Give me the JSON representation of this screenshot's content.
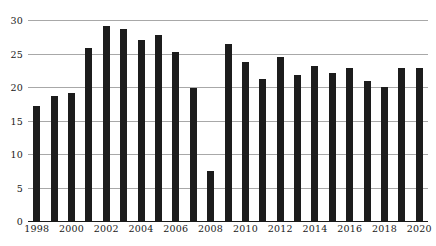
{
  "chart_data": {
    "type": "bar",
    "title": "",
    "xlabel": "",
    "ylabel": "",
    "ylim": [
      0,
      30
    ],
    "yticks": [
      0,
      5,
      10,
      15,
      20,
      25,
      30
    ],
    "grid": true,
    "legend": "none",
    "bar_color": "#1c1c1c",
    "gridline_color": "#a8a8a8",
    "axis_color": "#1a1a1a",
    "background_color": "#ffffff",
    "xtick_step": 2,
    "xtick_labels": [
      "1998",
      "2000",
      "2002",
      "2004",
      "2006",
      "2008",
      "2010",
      "2012",
      "2014",
      "2016",
      "2018",
      "2020"
    ],
    "categories": [
      "1998",
      "1999",
      "2000",
      "2001",
      "2002",
      "2003",
      "2004",
      "2005",
      "2006",
      "2007",
      "2008",
      "2009",
      "2010",
      "2011",
      "2012",
      "2013",
      "2014",
      "2015",
      "2016",
      "2017",
      "2018",
      "2019",
      "2020"
    ],
    "values": [
      17.2,
      18.6,
      19.1,
      25.8,
      29.1,
      28.7,
      27.0,
      27.7,
      25.3,
      19.8,
      7.5,
      26.4,
      23.8,
      21.2,
      24.5,
      21.8,
      23.1,
      22.1,
      22.8,
      20.9,
      20.0,
      22.9,
      22.8
    ]
  }
}
